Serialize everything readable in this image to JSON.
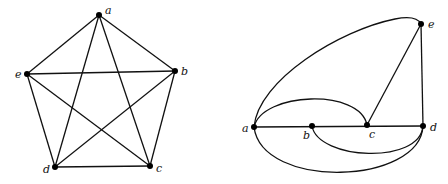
{
  "figure": {
    "left_graph": {
      "name": "K5 drawn as pentagon with pentagram",
      "nodes": [
        {
          "id": "a",
          "label": "a",
          "x": 99,
          "y": 15,
          "lx": 105,
          "ly": 14
        },
        {
          "id": "b",
          "label": "b",
          "x": 175,
          "y": 71,
          "lx": 181,
          "ly": 75
        },
        {
          "id": "c",
          "label": "c",
          "x": 150,
          "y": 166,
          "lx": 156,
          "ly": 172
        },
        {
          "id": "d",
          "label": "d",
          "x": 55,
          "y": 167,
          "lx": 43,
          "ly": 173
        },
        {
          "id": "e",
          "label": "e",
          "x": 27,
          "y": 74,
          "lx": 15,
          "ly": 78
        }
      ],
      "edges": [
        [
          "a",
          "b"
        ],
        [
          "a",
          "c"
        ],
        [
          "a",
          "d"
        ],
        [
          "a",
          "e"
        ],
        [
          "b",
          "c"
        ],
        [
          "b",
          "d"
        ],
        [
          "b",
          "e"
        ],
        [
          "c",
          "d"
        ],
        [
          "c",
          "e"
        ],
        [
          "d",
          "e"
        ]
      ]
    },
    "right_graph": {
      "name": "alternate drawing with curved edges",
      "nodes": [
        {
          "id": "a",
          "label": "a",
          "x": 254,
          "y": 127,
          "lx": 242,
          "ly": 132
        },
        {
          "id": "b",
          "label": "b",
          "x": 312,
          "y": 126,
          "lx": 303,
          "ly": 139
        },
        {
          "id": "c",
          "label": "c",
          "x": 367,
          "y": 125,
          "lx": 369,
          "ly": 138
        },
        {
          "id": "d",
          "label": "d",
          "x": 423,
          "y": 126,
          "lx": 430,
          "ly": 131
        },
        {
          "id": "e",
          "label": "e",
          "x": 421,
          "y": 24,
          "lx": 428,
          "ly": 28
        }
      ],
      "edges": [
        {
          "from": "a",
          "to": "d",
          "path": "M254,127 L423,126"
        },
        {
          "from": "c",
          "to": "e",
          "path": "M367,125 L421,24"
        },
        {
          "from": "e",
          "to": "d",
          "path": "M421,24 L423,126"
        },
        {
          "from": "a",
          "to": "e",
          "path": "M254,127 C258,80 340,30 395,19 C410,16 418,18 421,24"
        },
        {
          "from": "a",
          "to": "c",
          "path": "M254,127 C262,92 360,88 367,125"
        },
        {
          "from": "b",
          "to": "d",
          "path": "M312,126 C318,160 420,165 423,126"
        },
        {
          "from": "a",
          "to": "d",
          "path": "M254,127 C262,190 420,185 423,126"
        }
      ]
    },
    "labels": {
      "left": [
        "a",
        "b",
        "c",
        "d",
        "e"
      ],
      "right": [
        "a",
        "b",
        "c",
        "d",
        "e"
      ]
    }
  }
}
